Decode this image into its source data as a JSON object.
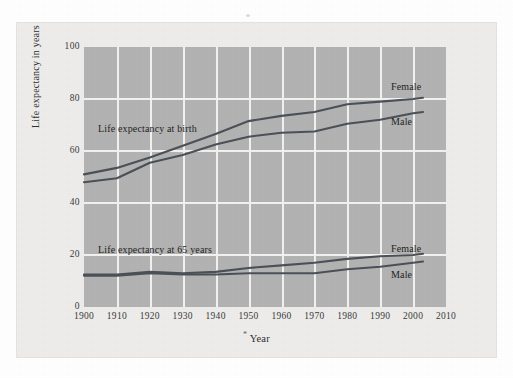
{
  "chart_data": {
    "type": "line",
    "title": "",
    "xlabel": "Year",
    "ylabel": "Life expectancy in years",
    "xlim": [
      1900,
      2010
    ],
    "ylim": [
      0,
      100
    ],
    "grid": true,
    "legend_position": "inline-right",
    "x_ticks": [
      "1900",
      "1910",
      "1920",
      "1930",
      "1940",
      "1950",
      "1960",
      "1970",
      "1980",
      "1990",
      "2000",
      "2010"
    ],
    "y_ticks": [
      "0",
      "20",
      "40",
      "60",
      "80",
      "100"
    ],
    "annotations": [
      {
        "text": "Life expectancy at birth",
        "x": 1906,
        "y": 68
      },
      {
        "text": "Life expectancy at 65 years",
        "x": 1906,
        "y": 22
      }
    ],
    "x": [
      1900,
      1910,
      1920,
      1930,
      1940,
      1950,
      1960,
      1970,
      1980,
      1990,
      2000,
      2003
    ],
    "series": [
      {
        "name": "Female",
        "group": "Life expectancy at birth",
        "label_x": 2000,
        "label_y": 85,
        "values": [
          51.0,
          53.5,
          57.5,
          62.0,
          66.5,
          71.5,
          73.5,
          75.0,
          78.0,
          79.0,
          80.0,
          80.5
        ]
      },
      {
        "name": "Male",
        "group": "Life expectancy at birth",
        "label_x": 2000,
        "label_y": 71,
        "values": [
          48.0,
          49.5,
          55.5,
          58.5,
          62.5,
          65.5,
          67.0,
          67.5,
          70.5,
          72.0,
          74.5,
          75.0
        ]
      },
      {
        "name": "Female",
        "group": "Life expectancy at 65 years",
        "label_x": 2000,
        "label_y": 24,
        "values": [
          12.5,
          12.5,
          13.5,
          13.0,
          13.5,
          15.0,
          16.0,
          17.0,
          18.5,
          19.5,
          20.0,
          20.5
        ]
      },
      {
        "name": "Male",
        "group": "Life expectancy at 65 years",
        "label_x": 2000,
        "label_y": 15,
        "values": [
          12.0,
          12.0,
          13.0,
          12.5,
          12.5,
          13.0,
          13.0,
          13.0,
          14.5,
          15.5,
          17.0,
          17.5
        ]
      }
    ],
    "colors": {
      "line": "#4c5158",
      "plot_background": "#b3b3b3",
      "gridline": "#f2f2f0",
      "page_background": "#eeedeb",
      "text": "#1f1f1f"
    }
  },
  "figure": {
    "ylabel": "Life expectancy in years",
    "xlabel": "Year",
    "xlabel_marker": "*",
    "annotation_birth": "Life expectancy at birth",
    "annotation_65": "Life expectancy at 65 years",
    "label_birth_female": "Female",
    "label_birth_male": "Male",
    "label_65_female": "Female",
    "label_65_male": "Male",
    "y_ticks": [
      "100",
      "80",
      "60",
      "40",
      "20",
      "0"
    ],
    "x_ticks": [
      "1900",
      "1910",
      "1920",
      "1930",
      "1940",
      "1950",
      "1960",
      "1970",
      "1980",
      "1990",
      "2000",
      "2010"
    ]
  }
}
